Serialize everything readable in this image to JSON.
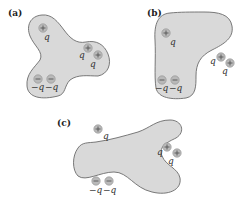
{
  "figure": {
    "colors": {
      "background": "#ffffff",
      "blob_fill": "#d9d9d9",
      "blob_stroke": "#6b6b6b",
      "charge_fill": "#b9b9b9"
    },
    "panels": [
      {
        "label": "(a)",
        "charges": [
          {
            "sign": "+",
            "label": "q"
          },
          {
            "sign": "+",
            "label": "q"
          },
          {
            "sign": "+",
            "label": "q"
          },
          {
            "sign": "−",
            "label": "−q"
          },
          {
            "sign": "−",
            "label": "−q"
          }
        ]
      },
      {
        "label": "(b)",
        "charges": [
          {
            "sign": "+",
            "label": "q"
          },
          {
            "sign": "−",
            "label": "−q"
          },
          {
            "sign": "−",
            "label": "−q"
          },
          {
            "sign": "+",
            "label": "q"
          },
          {
            "sign": "+",
            "label": "q"
          }
        ]
      },
      {
        "label": "(c)",
        "charges": [
          {
            "sign": "+",
            "label": "q"
          },
          {
            "sign": "+",
            "label": "q"
          },
          {
            "sign": "+",
            "label": "q"
          },
          {
            "sign": "−",
            "label": "−q"
          },
          {
            "sign": "−",
            "label": "−q"
          }
        ]
      }
    ]
  }
}
